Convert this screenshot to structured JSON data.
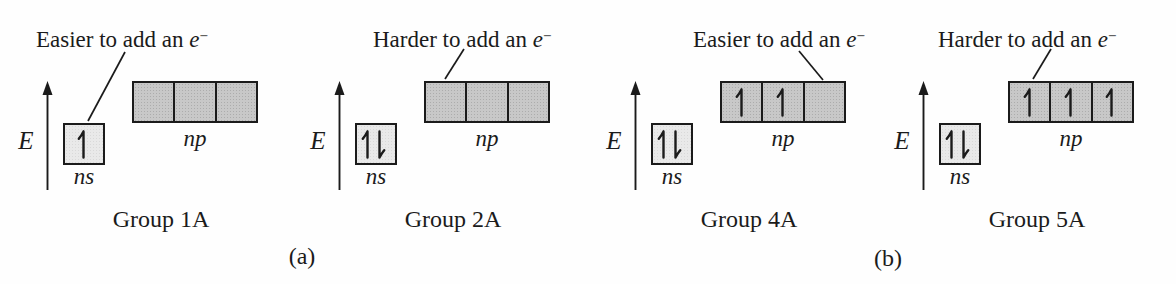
{
  "figure": {
    "energy_axis_label": "E",
    "section_labels": [
      {
        "label": "(a)"
      },
      {
        "label": "(b)"
      }
    ],
    "colors": {
      "ink": "#1b1b1b",
      "ns_box_fill": "#e9e9e9",
      "np_box_fill": "#c8c8c8"
    },
    "panels": [
      {
        "group_label": "Group 1A",
        "annotation": {
          "prefix": "Easier to add an ",
          "symbol": "e",
          "charge": "−"
        },
        "annotation_points_to": "ns",
        "ns_label": "ns",
        "np_label": "np",
        "ns_electrons": "up",
        "np_electrons": [
          "none",
          "none",
          "none"
        ]
      },
      {
        "group_label": "Group 2A",
        "annotation": {
          "prefix": "Harder to add an ",
          "symbol": "e",
          "charge": "−"
        },
        "annotation_points_to": "np",
        "ns_label": "ns",
        "np_label": "np",
        "ns_electrons": "paired",
        "np_electrons": [
          "none",
          "none",
          "none"
        ]
      },
      {
        "group_label": "Group 4A",
        "annotation": {
          "prefix": "Easier to add an ",
          "symbol": "e",
          "charge": "−"
        },
        "annotation_points_to": "np",
        "ns_label": "ns",
        "np_label": "np",
        "ns_electrons": "paired",
        "np_electrons": [
          "up",
          "up",
          "none"
        ]
      },
      {
        "group_label": "Group 5A",
        "annotation": {
          "prefix": "Harder to add an ",
          "symbol": "e",
          "charge": "−"
        },
        "annotation_points_to": "np",
        "ns_label": "ns",
        "np_label": "np",
        "ns_electrons": "paired",
        "np_electrons": [
          "up",
          "up",
          "up"
        ]
      }
    ]
  }
}
